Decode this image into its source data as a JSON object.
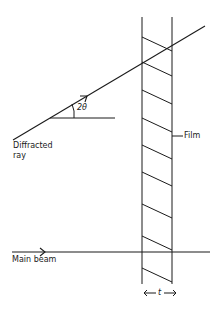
{
  "diagram": {
    "type": "geometry-schematic",
    "colors": {
      "ink": "#1a1a1a",
      "background": "#ffffff"
    },
    "labels": {
      "angle": "2θ",
      "diffracted_line1": "Diffracted",
      "diffracted_line2": "ray",
      "film": "Film",
      "main_beam": "Main beam",
      "thickness": "t"
    },
    "film": {
      "left_x": 142,
      "right_x": 172,
      "top_y": 17,
      "bottom_y": 284,
      "hatch_left_y": [
        37,
        62,
        90,
        118,
        145,
        172,
        204,
        236,
        268
      ],
      "hatch_drop": 14
    },
    "diffracted_ray": {
      "x1": 13,
      "y1": 140,
      "x2": 205,
      "y2": 26
    },
    "main_beam": {
      "x1": 12,
      "y1": 252,
      "x2": 210,
      "y2": 252
    },
    "angle_reference_line": {
      "x1": 50,
      "y1": 118,
      "x2": 115,
      "y2": 118
    }
  }
}
